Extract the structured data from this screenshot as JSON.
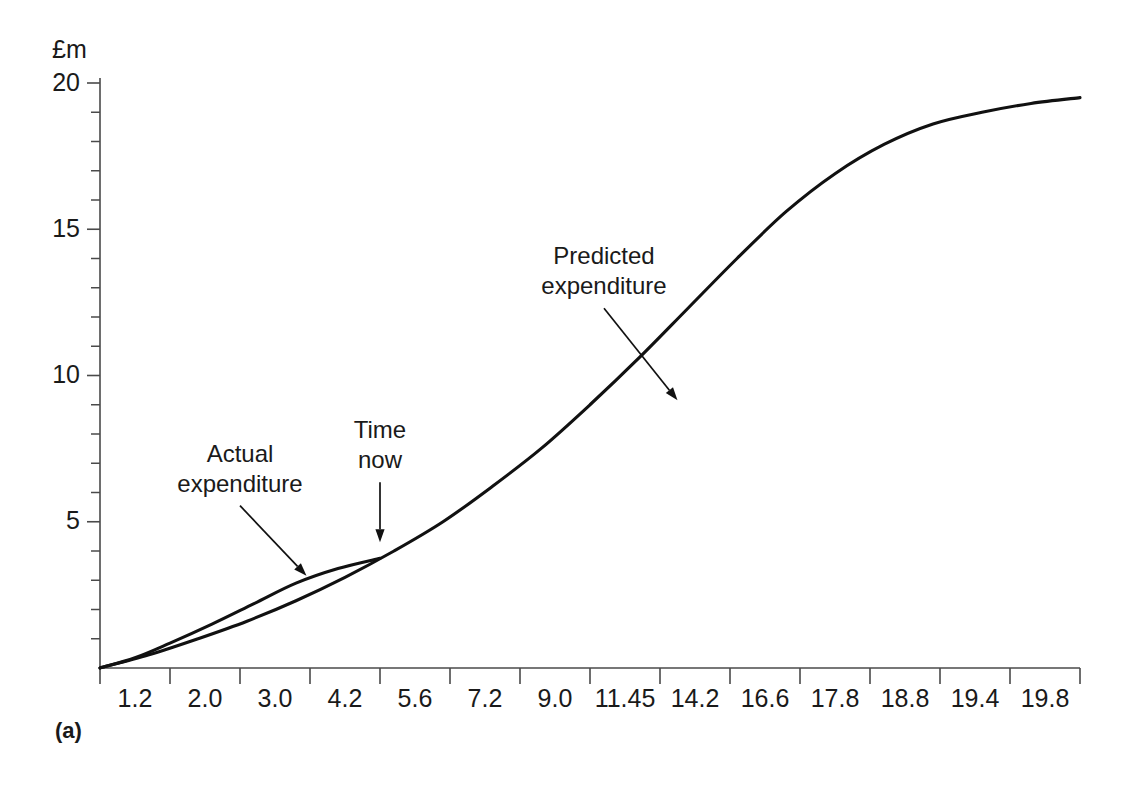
{
  "figure": {
    "panel_label": "(a)",
    "y_axis_unit": "£m"
  },
  "chart_data": {
    "type": "line",
    "title": "",
    "xlabel": "",
    "ylabel": "£m",
    "xlim": [
      0,
      14
    ],
    "ylim": [
      0,
      20
    ],
    "grid": false,
    "legend": "none",
    "y_ticks": [
      0,
      5,
      10,
      15,
      20
    ],
    "y_tick_labels": [
      "",
      "5",
      "10",
      "15",
      "20"
    ],
    "y_minor_tick_step": 1,
    "x_tick_labels": [
      "1.2",
      "2.0",
      "3.0",
      "4.2",
      "5.6",
      "7.2",
      "9.0",
      "11.45",
      "14.2",
      "16.6",
      "17.8",
      "18.8",
      "19.4",
      "19.8"
    ],
    "x_tick_note": "labels placed between evenly spaced tick marks; values are cumulative time units",
    "series": [
      {
        "name": "Predicted expenditure",
        "comment": "S-curve from origin rising to plateau at about 19.5",
        "x": [
          0,
          0.7,
          1.4,
          2.1,
          2.8,
          3.5,
          4.2,
          4.9,
          5.6,
          6.3,
          7.0,
          7.7,
          8.4,
          9.1,
          9.8,
          10.5,
          11.2,
          11.9,
          12.6,
          13.3,
          14.0
        ],
        "y": [
          0.0,
          0.45,
          1.0,
          1.6,
          2.3,
          3.1,
          4.0,
          5.0,
          6.2,
          7.5,
          9.0,
          10.6,
          12.3,
          14.0,
          15.6,
          16.9,
          17.9,
          18.6,
          19.0,
          19.3,
          19.5
        ]
      },
      {
        "name": "Actual expenditure",
        "comment": "runs only up to Time now, slightly above the predicted curve",
        "x": [
          0,
          0.5,
          1.0,
          1.6,
          2.2,
          2.8,
          3.4,
          4.0
        ],
        "y": [
          0.0,
          0.35,
          0.85,
          1.5,
          2.2,
          2.9,
          3.4,
          3.75
        ]
      }
    ],
    "annotations": [
      {
        "id": "actual-expenditure",
        "lines": [
          "Actual",
          "expenditure"
        ],
        "arrow_from": [
          2.0,
          5.55
        ],
        "arrow_to": [
          2.95,
          3.15
        ]
      },
      {
        "id": "time-now",
        "lines": [
          "Time",
          "now"
        ],
        "arrow_from": [
          4.0,
          6.35
        ],
        "arrow_to": [
          4.0,
          4.3
        ]
      },
      {
        "id": "predicted-expenditure",
        "lines": [
          "Predicted",
          "expenditure"
        ],
        "arrow_from": [
          7.2,
          12.3
        ],
        "arrow_to": [
          8.25,
          9.15
        ]
      }
    ]
  }
}
